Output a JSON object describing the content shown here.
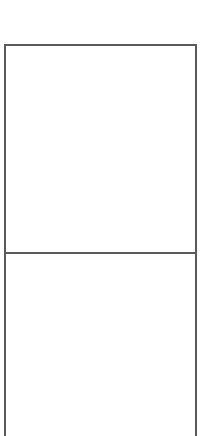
{
  "diagram": {
    "shape": "open-bottom rectangle divided into two stacked panels",
    "line_color": "#5a5a5a",
    "background_color": "#ffffff",
    "panels": [
      {
        "name": "upper",
        "label": ""
      },
      {
        "name": "lower",
        "label": ""
      }
    ]
  }
}
